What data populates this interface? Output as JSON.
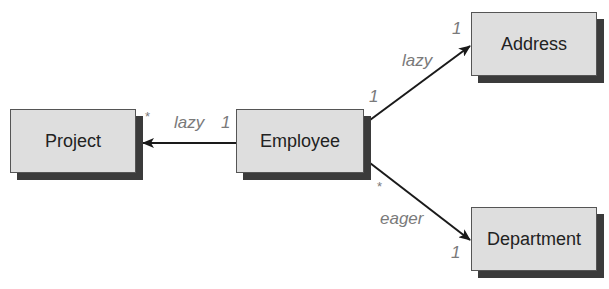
{
  "diagram": {
    "nodes": [
      {
        "id": "project",
        "label": "Project"
      },
      {
        "id": "employee",
        "label": "Employee"
      },
      {
        "id": "address",
        "label": "Address"
      },
      {
        "id": "department",
        "label": "Department"
      }
    ],
    "edges": [
      {
        "id": "employee-project",
        "from": "employee",
        "to": "project",
        "fetch": "lazy",
        "source_multiplicity": "1",
        "target_multiplicity": "*"
      },
      {
        "id": "employee-address",
        "from": "employee",
        "to": "address",
        "fetch": "lazy",
        "source_multiplicity": "1",
        "target_multiplicity": "1"
      },
      {
        "id": "employee-department",
        "from": "employee",
        "to": "department",
        "fetch": "eager",
        "source_multiplicity": "*",
        "target_multiplicity": "1"
      }
    ],
    "colors": {
      "box_fill": "#dedede",
      "box_shadow": "#3b3b3b",
      "label_text": "#7a7a7a",
      "node_text": "#222222",
      "edge": "#1a1a1a"
    }
  }
}
